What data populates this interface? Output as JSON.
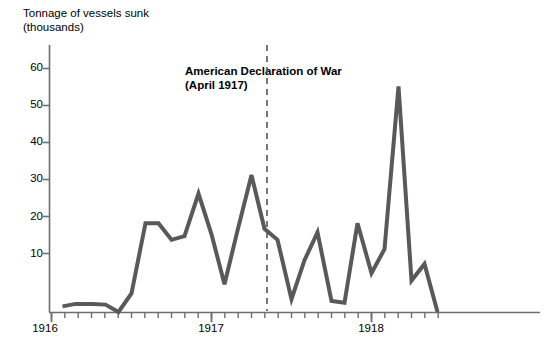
{
  "chart_data": {
    "type": "line",
    "title_line1": "Tonnage of vessels sunk",
    "title_line2": "(thousands)",
    "xlabel": "",
    "ylabel": "Tonnage of vessels sunk (thousands)",
    "ylim": [
      0,
      65
    ],
    "yticks": [
      10,
      20,
      30,
      40,
      50,
      60
    ],
    "ytick_labels": [
      "10",
      "20",
      "30",
      "40",
      "50",
      "60"
    ],
    "xlim": [
      "1916-01",
      "1918-08"
    ],
    "xticks": [
      "1916",
      "1917",
      "1918"
    ],
    "xtick_labels": [
      "1916",
      "1917",
      "1918"
    ],
    "x_minor_ticks": "monthly",
    "grid": false,
    "legend": null,
    "line_color": "#595959",
    "line_width": 4,
    "annotations": [
      {
        "text_line1": "American Declaration of War",
        "text_line2": "(April 1917)",
        "x": "1917-04",
        "style": "dashed vertical line",
        "line_color": "#555555"
      }
    ],
    "x": [
      "1916-02",
      "1916-03",
      "1916-04",
      "1916-05",
      "1916-06",
      "1916-07",
      "1916-08",
      "1916-09",
      "1916-10",
      "1916-11",
      "1916-12",
      "1917-01",
      "1917-02",
      "1917-03",
      "1917-04",
      "1917-05",
      "1917-06",
      "1917-07",
      "1917-08",
      "1917-09",
      "1917-10",
      "1917-11",
      "1917-12",
      "1918-01",
      "1918-02",
      "1918-03",
      "1918-04",
      "1918-05",
      "1918-06",
      "1918-07"
    ],
    "values": [
      1.5,
      2,
      2,
      2,
      0,
      5,
      24,
      21,
      24,
      19.5,
      20.5,
      32,
      7.5,
      37,
      22,
      19.5,
      3.5,
      14,
      21.5,
      2.5,
      24,
      10.5,
      17,
      13,
      61,
      8.5,
      13,
      1,
      0,
      0
    ],
    "series": [
      {
        "name": "Tonnage of vessels sunk",
        "points": [
          {
            "x_px": 62,
            "value": 1.5
          },
          {
            "x_px": 75,
            "value": 2.2
          },
          {
            "x_px": 92,
            "value": 2.2
          },
          {
            "x_px": 105,
            "value": 2.0
          },
          {
            "x_px": 118,
            "value": 0.0
          },
          {
            "x_px": 131,
            "value": 5.0
          },
          {
            "x_px": 145,
            "value": 24.0
          },
          {
            "x_px": 158,
            "value": 24.0
          },
          {
            "x_px": 171,
            "value": 19.5
          },
          {
            "x_px": 184,
            "value": 20.5
          },
          {
            "x_px": 198,
            "value": 32.0
          },
          {
            "x_px": 211,
            "value": 21.0
          },
          {
            "x_px": 224,
            "value": 7.5
          },
          {
            "x_px": 237,
            "value": 22.0
          },
          {
            "x_px": 251,
            "value": 37.0
          },
          {
            "x_px": 264,
            "value": 22.5
          },
          {
            "x_px": 277,
            "value": 19.5
          },
          {
            "x_px": 291,
            "value": 3.5
          },
          {
            "x_px": 304,
            "value": 14.0
          },
          {
            "x_px": 317,
            "value": 21.5
          },
          {
            "x_px": 331,
            "value": 3.0
          },
          {
            "x_px": 344,
            "value": 2.5
          },
          {
            "x_px": 357,
            "value": 24.0
          },
          {
            "x_px": 371,
            "value": 10.5
          },
          {
            "x_px": 384,
            "value": 17.0
          },
          {
            "x_px": 398,
            "value": 61.0
          },
          {
            "x_px": 411,
            "value": 8.5
          },
          {
            "x_px": 424,
            "value": 13.0
          },
          {
            "x_px": 437,
            "value": 0.0
          }
        ]
      }
    ]
  },
  "axes": {
    "y_axis_label_line1": "Tonnage of vessels sunk",
    "y_axis_label_line2": "(thousands)",
    "y_labels": [
      "60",
      "50",
      "40",
      "30",
      "20",
      "10"
    ],
    "x_labels": [
      "1916",
      "1917",
      "1918"
    ]
  },
  "annotation": {
    "line1": "American Declaration of War",
    "line2": "(April 1917)"
  },
  "colors": {
    "line": "#595959",
    "axis": "#6e6e6e",
    "annotation_line": "#555555",
    "background": "#ffffff",
    "text": "#000000"
  }
}
